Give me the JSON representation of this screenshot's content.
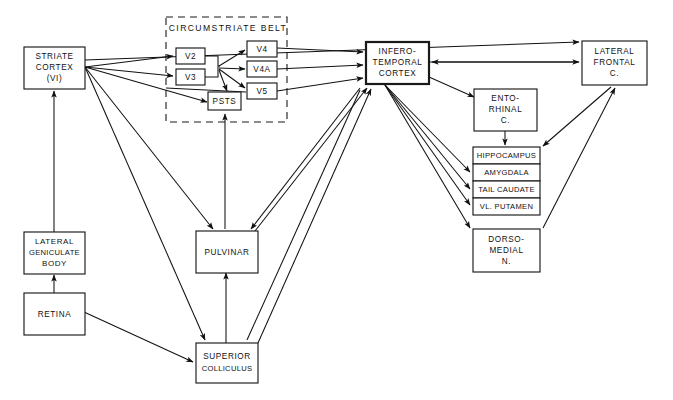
{
  "diagram": {
    "background_color": "#ffffff",
    "line_color": "#111111",
    "groups": [
      {
        "id": "circumstriate_belt",
        "label": "CIRCUMSTRIATE  BELT",
        "style": "dashed"
      }
    ],
    "nodes": [
      {
        "id": "striate_cortex",
        "lines": [
          "STRIATE",
          "CORTEX",
          "(VI)"
        ]
      },
      {
        "id": "v2",
        "lines": [
          "V2"
        ]
      },
      {
        "id": "v3",
        "lines": [
          "V3"
        ]
      },
      {
        "id": "psts",
        "lines": [
          "PSTS"
        ]
      },
      {
        "id": "v4",
        "lines": [
          "V4"
        ]
      },
      {
        "id": "v4a",
        "lines": [
          "V4A"
        ]
      },
      {
        "id": "v5",
        "lines": [
          "V5"
        ]
      },
      {
        "id": "inferotemporal_cortex",
        "lines": [
          "INFERO-",
          "TEMPORAL",
          "CORTEX"
        ]
      },
      {
        "id": "lateral_frontal_c",
        "lines": [
          "LATERAL",
          "FRONTAL",
          "C."
        ]
      },
      {
        "id": "entorhinal_c",
        "lines": [
          "ENTO-",
          "RHINAL",
          "C."
        ]
      },
      {
        "id": "hippocampus",
        "lines": [
          "HIPPOCAMPUS"
        ]
      },
      {
        "id": "amygdala",
        "lines": [
          "AMYGDALA"
        ]
      },
      {
        "id": "tail_caudate",
        "lines": [
          "TAIL CAUDATE"
        ]
      },
      {
        "id": "vl_putamen",
        "lines": [
          "VL. PUTAMEN"
        ]
      },
      {
        "id": "dorsomedial_n",
        "lines": [
          "DORSO-",
          "MEDIAL",
          "N."
        ]
      },
      {
        "id": "pulvinar",
        "lines": [
          "PULVINAR"
        ]
      },
      {
        "id": "lateral_geniculate_body",
        "lines": [
          "LATERAL",
          "GENICULATE",
          "BODY"
        ]
      },
      {
        "id": "retina",
        "lines": [
          "RETINA"
        ]
      },
      {
        "id": "superior_colliculus",
        "lines": [
          "SUPERIOR",
          "COLLICULUS"
        ]
      }
    ],
    "edges": [
      {
        "from": "retina",
        "to": "lateral_geniculate_body"
      },
      {
        "from": "retina",
        "to": "superior_colliculus"
      },
      {
        "from": "lateral_geniculate_body",
        "to": "striate_cortex"
      },
      {
        "from": "striate_cortex",
        "to": "v2"
      },
      {
        "from": "striate_cortex",
        "to": "v3"
      },
      {
        "from": "striate_cortex",
        "to": "psts"
      },
      {
        "from": "striate_cortex",
        "to": "pulvinar"
      },
      {
        "from": "striate_cortex",
        "to": "superior_colliculus"
      },
      {
        "from": "v2",
        "to": "v4"
      },
      {
        "from": "v2",
        "to": "v4a"
      },
      {
        "from": "v2",
        "to": "v5"
      },
      {
        "from": "v2",
        "to": "psts"
      },
      {
        "from": "v3",
        "to": "v4"
      },
      {
        "from": "v4",
        "to": "inferotemporal_cortex"
      },
      {
        "from": "v4a",
        "to": "inferotemporal_cortex"
      },
      {
        "from": "v5",
        "to": "inferotemporal_cortex"
      },
      {
        "from": "psts",
        "to": "inferotemporal_cortex"
      },
      {
        "from": "striate_cortex",
        "to": "lateral_frontal_c"
      },
      {
        "from": "inferotemporal_cortex",
        "to": "lateral_frontal_c"
      },
      {
        "from": "lateral_frontal_c",
        "to": "inferotemporal_cortex"
      },
      {
        "from": "inferotemporal_cortex",
        "to": "entorhinal_c"
      },
      {
        "from": "entorhinal_c",
        "to": "hippocampus"
      },
      {
        "from": "hippocampus",
        "to": "lateral_frontal_c"
      },
      {
        "from": "inferotemporal_cortex",
        "to": "amygdala"
      },
      {
        "from": "inferotemporal_cortex",
        "to": "tail_caudate"
      },
      {
        "from": "inferotemporal_cortex",
        "to": "vl_putamen"
      },
      {
        "from": "inferotemporal_cortex",
        "to": "dorsomedial_n"
      },
      {
        "from": "dorsomedial_n",
        "to": "lateral_frontal_c"
      },
      {
        "from": "pulvinar",
        "to": "inferotemporal_cortex"
      },
      {
        "from": "superior_colliculus",
        "to": "pulvinar"
      },
      {
        "from": "superior_colliculus",
        "to": "inferotemporal_cortex"
      },
      {
        "from": "psts",
        "to": "pulvinar"
      }
    ]
  }
}
